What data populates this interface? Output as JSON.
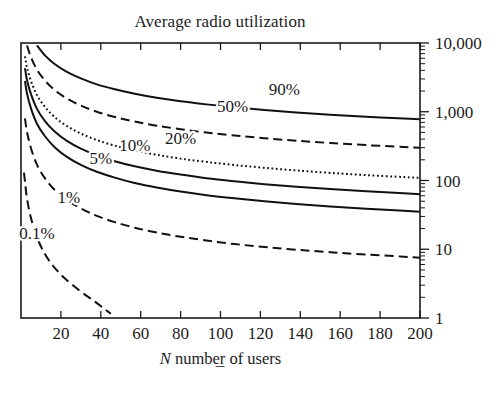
{
  "figure": {
    "title": "Average radio utilization",
    "footer_mark": "–"
  },
  "chart_data": {
    "type": "line",
    "title": "Average radio utilization",
    "xlabel": "N number of users",
    "xlabel_parts": {
      "symbol": "N",
      "rest": " number of users"
    },
    "ylabel": "",
    "xlim": [
      0,
      200
    ],
    "ylim": [
      1,
      10000
    ],
    "yscale": "log",
    "xscale": "linear",
    "grid": false,
    "legend": "inline-curve-labels",
    "xticks": [
      20,
      40,
      60,
      80,
      100,
      120,
      140,
      160,
      180,
      200
    ],
    "xticklabels": [
      "20",
      "40",
      "60",
      "80",
      "100",
      "120",
      "140",
      "160",
      "180",
      "200"
    ],
    "yticks": [
      1,
      10,
      100,
      1000,
      10000
    ],
    "yticklabels": [
      "1",
      "10",
      "100",
      "1,000",
      "10,000"
    ],
    "y_axis_side": "right",
    "x_axis_ticks_both_sides": true,
    "series": [
      {
        "name": "90%",
        "label": "90%",
        "style": "solid",
        "label_x": 132,
        "label_y": 2150,
        "x": [
          2,
          3,
          5,
          8,
          12,
          17,
          23,
          30,
          38,
          47,
          57,
          68,
          80,
          93,
          107,
          122,
          138,
          155,
          173,
          192,
          200
        ],
        "y": [
          26000,
          19000,
          13500,
          9200,
          6600,
          4900,
          3800,
          3050,
          2500,
          2120,
          1830,
          1600,
          1420,
          1280,
          1160,
          1060,
          975,
          905,
          845,
          795,
          775
        ]
      },
      {
        "name": "50%",
        "label": "50%",
        "style": "dashed",
        "label_x": 106,
        "label_y": 1230,
        "x": [
          2,
          3,
          5,
          8,
          12,
          17,
          23,
          30,
          38,
          47,
          57,
          68,
          80,
          93,
          107,
          122,
          138,
          155,
          173,
          192,
          200
        ],
        "y": [
          13000,
          9200,
          6200,
          4100,
          2850,
          2050,
          1560,
          1230,
          1000,
          840,
          720,
          628,
          556,
          498,
          452,
          412,
          379,
          351,
          327,
          307,
          299
        ]
      },
      {
        "name": "20%",
        "label": "20%",
        "style": "dotted",
        "label_x": 80,
        "label_y": 420,
        "x": [
          2,
          3,
          5,
          8,
          12,
          17,
          23,
          30,
          38,
          47,
          57,
          68,
          80,
          93,
          107,
          122,
          138,
          155,
          173,
          192,
          200
        ],
        "y": [
          6400,
          4400,
          2800,
          1750,
          1180,
          830,
          620,
          482,
          388,
          322,
          273,
          237,
          208,
          186,
          168,
          153,
          140,
          129,
          120,
          112,
          109
        ]
      },
      {
        "name": "10%",
        "label": "10%",
        "style": "solid",
        "label_x": 57,
        "label_y": 330,
        "x": [
          2,
          3,
          5,
          8,
          12,
          17,
          23,
          30,
          38,
          47,
          57,
          68,
          80,
          93,
          107,
          122,
          138,
          155,
          173,
          192,
          200
        ],
        "y": [
          4300,
          2900,
          1800,
          1100,
          730,
          510,
          376,
          290,
          232,
          191,
          161,
          139,
          122,
          108,
          97.5,
          88.5,
          81.2,
          75.0,
          69.6,
          65.0,
          63.2
        ]
      },
      {
        "name": "5%",
        "label": "5%",
        "style": "solid",
        "label_x": 40,
        "label_y": 212,
        "x": [
          2,
          3,
          5,
          8,
          12,
          17,
          23,
          30,
          38,
          47,
          57,
          68,
          80,
          93,
          107,
          122,
          138,
          155,
          173,
          192,
          200
        ],
        "y": [
          2800,
          1850,
          1120,
          670,
          440,
          303,
          221,
          169,
          134,
          110,
          92,
          79,
          69,
          61.2,
          55.0,
          49.8,
          45.6,
          42.0,
          38.9,
          36.3,
          35.2
        ]
      },
      {
        "name": "1%",
        "label": "1%",
        "style": "dashed",
        "label_x": 24,
        "label_y": 57,
        "x": [
          2,
          3,
          5,
          8,
          12,
          17,
          23,
          30,
          38,
          47,
          57,
          68,
          80,
          93,
          107,
          122,
          138,
          155,
          173,
          192,
          200
        ],
        "y": [
          800,
          510,
          295,
          170,
          108,
          72.5,
          52.0,
          39.2,
          30.6,
          24.8,
          20.6,
          17.5,
          15.2,
          13.4,
          11.9,
          10.8,
          9.85,
          9.05,
          8.37,
          7.8,
          7.55
        ]
      },
      {
        "name": "0.1%",
        "label": "0.1%",
        "style": "dashed",
        "label_x": 8,
        "label_y": 17,
        "x": [
          1.5,
          2,
          3,
          5,
          8,
          12,
          17,
          23,
          30,
          36,
          41,
          45
        ],
        "y": [
          130,
          96,
          55,
          28.5,
          15.0,
          8.5,
          5.3,
          3.55,
          2.42,
          1.82,
          1.42,
          1.15
        ]
      }
    ]
  },
  "plot_geometry": {
    "left": 21,
    "right": 420,
    "top": 43,
    "bottom": 318
  }
}
